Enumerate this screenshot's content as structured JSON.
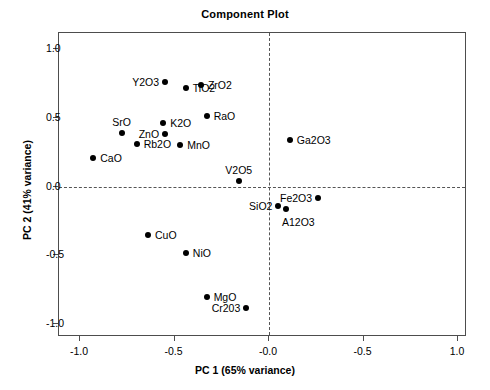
{
  "chart_data": {
    "type": "scatter",
    "title": "Component Plot",
    "xlabel": "PC 1 (65% variance)",
    "ylabel": "PC 2 (41% variance)",
    "xlim": [
      -1.11,
      1.05
    ],
    "ylim": [
      -1.12,
      1.12
    ],
    "xticks": [
      -1.0,
      -0.5,
      0.0,
      0.5,
      1.0
    ],
    "xticklabels": [
      "-1.0",
      "-0.5",
      "-0.0",
      "-0.5",
      "1.0"
    ],
    "yticks": [
      1.0,
      0.5,
      0.0,
      -0.5,
      -1.0
    ],
    "yticklabels": [
      "1.0",
      "0.5",
      "0.0",
      "-0.5",
      "-1.0"
    ],
    "grid": false,
    "legend": "none",
    "reference_lines": {
      "vertical_x": 0.0,
      "horizontal_y": 0.0,
      "style": "dashed"
    },
    "marker": {
      "shape": "circle",
      "color": "#000000",
      "size": 6
    },
    "points": [
      {
        "label": "ZrO2",
        "x": -0.36,
        "y": 0.74,
        "lpos": "r"
      },
      {
        "label": "RaO",
        "x": -0.33,
        "y": 0.51,
        "lpos": "r"
      },
      {
        "label": "SrO",
        "x": -0.78,
        "y": 0.39,
        "lpos": "t"
      },
      {
        "label": "Rb2O",
        "x": -0.7,
        "y": 0.31,
        "lpos": "r"
      },
      {
        "label": "CaO",
        "x": -0.93,
        "y": 0.21,
        "lpos": "r"
      },
      {
        "label": "Y2O3",
        "x": -0.55,
        "y": 0.76,
        "lpos": "l"
      },
      {
        "label": "TiO2",
        "x": -0.44,
        "y": 0.72,
        "lpos": "r"
      },
      {
        "label": "K2O",
        "x": -0.56,
        "y": 0.46,
        "lpos": "r"
      },
      {
        "label": "ZnO",
        "x": -0.55,
        "y": 0.38,
        "lpos": "l"
      },
      {
        "label": "MnO",
        "x": -0.47,
        "y": 0.3,
        "lpos": "r"
      },
      {
        "label": "Ga2O3",
        "x": 0.11,
        "y": 0.34,
        "lpos": "r"
      },
      {
        "label": "V2O5",
        "x": -0.16,
        "y": 0.04,
        "lpos": "t"
      },
      {
        "label": "Fe2O3",
        "x": 0.26,
        "y": -0.08,
        "lpos": "l"
      },
      {
        "label": "SiO2",
        "x": 0.05,
        "y": -0.14,
        "lpos": "l"
      },
      {
        "label": "A12O3",
        "x": 0.09,
        "y": -0.16,
        "lpos": "b"
      },
      {
        "label": "CuO",
        "x": -0.64,
        "y": -0.35,
        "lpos": "r"
      },
      {
        "label": "NiO",
        "x": -0.44,
        "y": -0.48,
        "lpos": "r"
      },
      {
        "label": "MgO",
        "x": -0.33,
        "y": -0.8,
        "lpos": "r"
      },
      {
        "label": "Cr203",
        "x": -0.12,
        "y": -0.88,
        "lpos": "l"
      }
    ]
  }
}
